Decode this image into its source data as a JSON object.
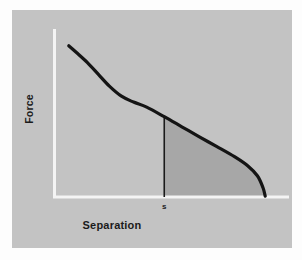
{
  "figure": {
    "kind": "line-plot-with-shaded-area",
    "panel_background": "#c3c3c3",
    "outer_background": "#fdfdfd",
    "axis_color": "#f2f2f2",
    "curve_color": "#141414",
    "shaded_area_color": "#a7a7a7",
    "marker_line_color": "#1a1a1a"
  },
  "labels": {
    "y_axis": "Force",
    "x_axis": "Separation",
    "marker_tick": "s"
  },
  "chart_data": {
    "type": "line",
    "title": "",
    "xlabel": "Separation",
    "ylabel": "Force",
    "grid": false,
    "legend": false,
    "axis_ticks": {
      "x": [
        "s"
      ],
      "y": []
    },
    "annotations": [
      {
        "name": "separation-marker",
        "label": "s",
        "x": 0.5,
        "description": "vertical line from the curve down to the x-axis at separation s"
      },
      {
        "name": "work-of-adhesion-area",
        "label": "",
        "description": "shaded region bounded by the curve above, the vertical line at s on the left, and the x-axis below"
      }
    ],
    "series": [
      {
        "name": "force-separation-curve",
        "x": [
          0.065,
          0.1,
          0.15,
          0.2,
          0.25,
          0.305,
          0.36,
          0.42,
          0.5,
          0.58,
          0.66,
          0.74,
          0.82,
          0.88,
          0.925,
          0.95,
          0.96
        ],
        "y": [
          0.9,
          0.86,
          0.8,
          0.73,
          0.66,
          0.6,
          0.565,
          0.535,
          0.478,
          0.418,
          0.358,
          0.3,
          0.24,
          0.186,
          0.125,
          0.055,
          0.005
        ]
      }
    ],
    "xlim": [
      0,
      1
    ],
    "ylim": [
      0,
      1
    ]
  }
}
